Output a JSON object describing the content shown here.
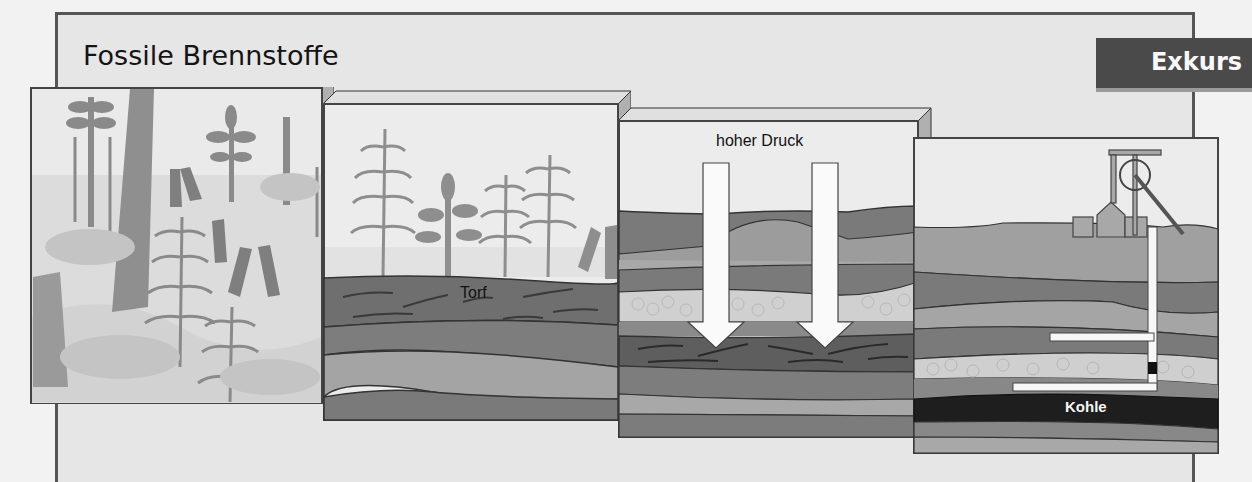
{
  "header": {
    "title": "Fossile Brennstoffe",
    "badge": "Exkurs"
  },
  "panels": [
    {
      "id": "forest",
      "description": "Karbon-Wald mit Farnen und Schachtelhalmen",
      "labels": []
    },
    {
      "id": "peat",
      "labels": [
        "Torf"
      ]
    },
    {
      "id": "pressure",
      "labels": [
        "hoher Druck"
      ]
    },
    {
      "id": "mine",
      "labels": [
        "Kohle"
      ]
    }
  ],
  "colors": {
    "frame_border": "#555555",
    "frame_fill": "#e6e6e6",
    "badge_bg": "#4a4a4a",
    "badge_text": "#fafafa",
    "sky": "#ececec",
    "plant": "#8c8c8c",
    "peat": "#6e6e6e",
    "layer_dark": "#7a7a7a",
    "layer_mid": "#9a9a9a",
    "layer_light": "#b3b3b3",
    "gravel": "#cfcfcf",
    "coal": "#202020"
  }
}
